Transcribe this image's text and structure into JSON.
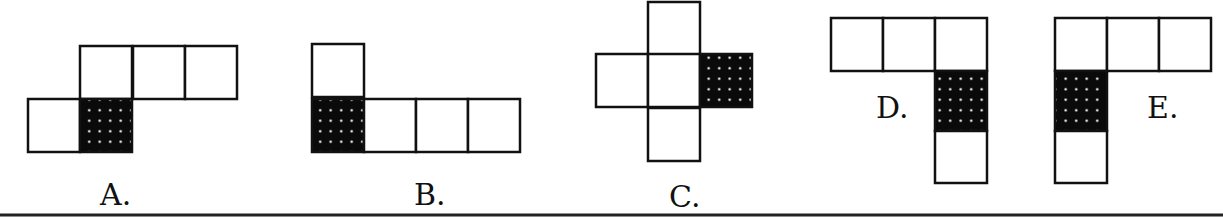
{
  "figure": {
    "colors": {
      "line": "#111111",
      "shaded": "#0a0a0a",
      "dot": "#ffffff",
      "background": "#ffffff"
    },
    "options": [
      {
        "label": "A.",
        "cells": [
          {
            "x": 80,
            "y": 46,
            "shaded": false
          },
          {
            "x": 133,
            "y": 46,
            "shaded": false
          },
          {
            "x": 185,
            "y": 46,
            "shaded": false
          },
          {
            "x": 28,
            "y": 99,
            "shaded": false
          },
          {
            "x": 80,
            "y": 99,
            "shaded": true
          }
        ],
        "label_pos": {
          "x": 100,
          "y": 205
        }
      },
      {
        "label": "B.",
        "cells": [
          {
            "x": 312,
            "y": 44,
            "shaded": false
          },
          {
            "x": 312,
            "y": 99,
            "shaded": true
          },
          {
            "x": 364,
            "y": 99,
            "shaded": false
          },
          {
            "x": 416,
            "y": 99,
            "shaded": false
          },
          {
            "x": 468,
            "y": 99,
            "shaded": false
          }
        ],
        "label_pos": {
          "x": 414,
          "y": 205
        }
      },
      {
        "label": "C.",
        "cells": [
          {
            "x": 648,
            "y": 2,
            "shaded": false
          },
          {
            "x": 596,
            "y": 54,
            "shaded": false
          },
          {
            "x": 648,
            "y": 54,
            "shaded": false
          },
          {
            "x": 700,
            "y": 54,
            "shaded": true
          },
          {
            "x": 648,
            "y": 108,
            "shaded": false
          }
        ],
        "label_pos": {
          "x": 669,
          "y": 207
        }
      },
      {
        "label": "D.",
        "cells": [
          {
            "x": 831,
            "y": 18,
            "shaded": false
          },
          {
            "x": 883,
            "y": 18,
            "shaded": false
          },
          {
            "x": 935,
            "y": 18,
            "shaded": false
          },
          {
            "x": 935,
            "y": 71,
            "shaded": true
          },
          {
            "x": 935,
            "y": 131,
            "shaded": false
          }
        ],
        "label_pos": {
          "x": 876,
          "y": 118
        }
      },
      {
        "label": "E.",
        "cells": [
          {
            "x": 1055,
            "y": 18,
            "shaded": false
          },
          {
            "x": 1107,
            "y": 18,
            "shaded": false
          },
          {
            "x": 1159,
            "y": 18,
            "shaded": false
          },
          {
            "x": 1055,
            "y": 71,
            "shaded": true
          },
          {
            "x": 1055,
            "y": 131,
            "shaded": false
          }
        ],
        "label_pos": {
          "x": 1147,
          "y": 118
        }
      }
    ]
  }
}
